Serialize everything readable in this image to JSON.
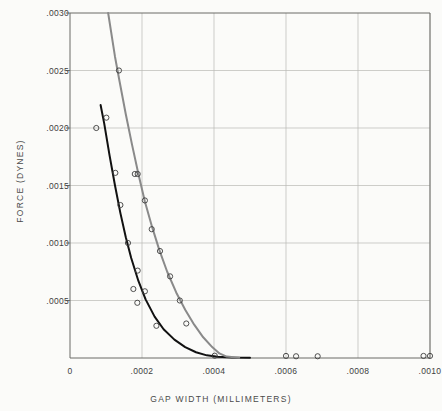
{
  "chart_data": {
    "type": "scatter",
    "title": "",
    "xlabel": "GAP WIDTH (MILLIMETERS)",
    "ylabel": "FORCE (DYNES)",
    "xlim": [
      0,
      0.001
    ],
    "ylim": [
      0,
      0.003
    ],
    "xticks": [
      0,
      0.0002,
      0.0004,
      0.0006,
      0.0008,
      0.001
    ],
    "xticklabels": [
      "0",
      ".0002",
      ".0004",
      ".0006",
      ".0008",
      ".0010"
    ],
    "yticks": [
      0.0005,
      0.001,
      0.0015,
      0.002,
      0.0025,
      0.003
    ],
    "yticklabels": [
      ".0005",
      ".0010",
      ".0015",
      ".0020",
      ".0025",
      ".0030"
    ],
    "grid": true,
    "legend": "none",
    "marker_style": "open-circle",
    "series": [
      {
        "name": "black-curve",
        "color": "#111111",
        "line_width": 2.0,
        "curve": [
          [
            8.5e-05,
            0.0022
          ],
          [
            9.5e-05,
            0.00204
          ],
          [
            0.00011,
            0.00176
          ],
          [
            0.000125,
            0.0015
          ],
          [
            0.00014,
            0.00126
          ],
          [
            0.000155,
            0.00105
          ],
          [
            0.00017,
            0.00087
          ],
          [
            0.00019,
            0.00067
          ],
          [
            0.00021,
            0.00051
          ],
          [
            0.000235,
            0.00036
          ],
          [
            0.00026,
            0.00025
          ],
          [
            0.00029,
            0.00016
          ],
          [
            0.00032,
            9.5e-05
          ],
          [
            0.00035,
            5e-05
          ],
          [
            0.00038,
            2.3e-05
          ],
          [
            0.00041,
            1e-05
          ],
          [
            0.00045,
            4e-06
          ],
          [
            0.0005,
            2e-06
          ]
        ],
        "points": [
          [
            7.3e-05,
            0.002
          ],
          [
            0.000101,
            0.00209
          ],
          [
            0.000126,
            0.00161
          ],
          [
            0.00014,
            0.00133
          ],
          [
            0.000161,
            0.001
          ],
          [
            0.000188,
            0.00076
          ],
          [
            0.000176,
            0.0006
          ],
          [
            0.000208,
            0.00058
          ],
          [
            0.000187,
            0.00048
          ],
          [
            0.00024,
            0.00028
          ]
        ]
      },
      {
        "name": "gray-curve",
        "color": "#8a8a8a",
        "line_width": 2.0,
        "curve": [
          [
            0.000106,
            0.003
          ],
          [
            0.000125,
            0.00262
          ],
          [
            0.000138,
            0.0024
          ],
          [
            0.000155,
            0.00212
          ],
          [
            0.000172,
            0.00186
          ],
          [
            0.00019,
            0.0016
          ],
          [
            0.000208,
            0.00136
          ],
          [
            0.000228,
            0.00114
          ],
          [
            0.000248,
            0.00094
          ],
          [
            0.00027,
            0.00075
          ],
          [
            0.000295,
            0.00057
          ],
          [
            0.00032,
            0.00042
          ],
          [
            0.000345,
            0.00029
          ],
          [
            0.00037,
            0.00018
          ],
          [
            0.000395,
            9.5e-05
          ],
          [
            0.000415,
            4e-05
          ],
          [
            0.000435,
            1.2e-05
          ],
          [
            0.00047,
            3e-06
          ]
        ],
        "points": [
          [
            0.000136,
            0.0025
          ],
          [
            0.00018,
            0.0016
          ],
          [
            0.000188,
            0.0016
          ],
          [
            0.000208,
            0.00137
          ],
          [
            0.000227,
            0.00112
          ],
          [
            0.00025,
            0.00093
          ],
          [
            0.000278,
            0.00071
          ],
          [
            0.000305,
            0.0005
          ],
          [
            0.000323,
            0.0003
          ],
          [
            0.000402,
            2e-05
          ]
        ]
      },
      {
        "name": "baseline-points",
        "color": "#6d6d6d",
        "line_width": 0,
        "curve": [],
        "points": [
          [
            0.0006,
            1.8e-05
          ],
          [
            0.000628,
            1.5e-05
          ],
          [
            0.000688,
            1.5e-05
          ],
          [
            0.000982,
            1.8e-05
          ],
          [
            0.001,
            1.8e-05
          ]
        ]
      }
    ]
  },
  "plot_frame": {
    "left_px": 70,
    "right_px": 430,
    "top_px": 13,
    "bottom_px": 358
  }
}
